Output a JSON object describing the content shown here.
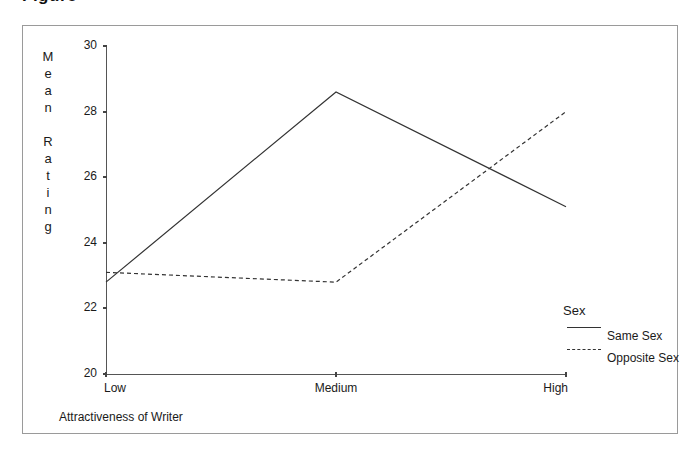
{
  "caption_stub": "Figure",
  "chart_data": {
    "type": "line",
    "title": "",
    "xlabel": "Attractiveness of Writer",
    "ylabel": "Mean Rating",
    "ylabel_stacked": "M\ne\na\nn\n\nR\na\nt\ni\nn\ng",
    "categories": [
      "Low",
      "Medium",
      "High"
    ],
    "ylim": [
      20,
      30
    ],
    "yticks": [
      30,
      28,
      26,
      24,
      22,
      20
    ],
    "ytick_labels": [
      "30",
      "28",
      "26",
      "24",
      "22",
      "20"
    ],
    "grid": false,
    "legend_position": "right",
    "legend_title": "Sex",
    "series": [
      {
        "name": "Same Sex",
        "style": "solid",
        "color": "#333333",
        "values": [
          22.8,
          28.6,
          25.1
        ]
      },
      {
        "name": "Opposite Sex",
        "style": "dashed",
        "color": "#333333",
        "values": [
          23.1,
          22.8,
          28.0
        ]
      }
    ]
  }
}
